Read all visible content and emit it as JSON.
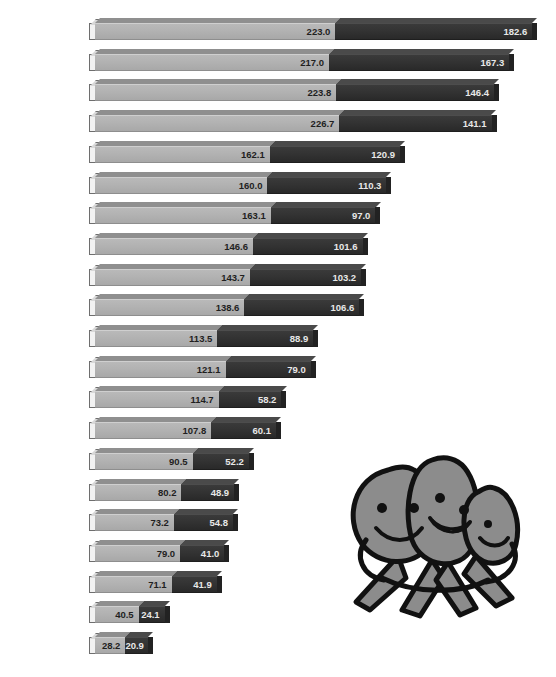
{
  "chart_data": {
    "type": "bar",
    "title": "",
    "subtitle": "",
    "xlabel": "",
    "ylabel": "",
    "orientation": "horizontal",
    "stacked": true,
    "grid": false,
    "legend_position": "none",
    "axis_visible": false,
    "xlim": [
      0,
      410
    ],
    "highlight_category": "United States",
    "categories": [
      "Finland",
      "United Kingdom",
      "Norway",
      "Ireland",
      "Australia",
      "New Zealand",
      "Iceland",
      "Netherlands",
      "Germany",
      "Austria",
      "United States",
      "Canada",
      "Greece",
      "Luxembourg",
      "Italy",
      "Portugal",
      "France",
      "Spain",
      "East Germany",
      "Soviet Union",
      "Japan"
    ],
    "series": [
      {
        "name": "light-segment",
        "color": "#b2b2b2",
        "values": [
          223.0,
          217.0,
          223.8,
          226.7,
          162.1,
          160.0,
          163.1,
          146.6,
          143.7,
          138.6,
          113.5,
          121.1,
          114.7,
          107.8,
          90.5,
          80.2,
          73.2,
          79.0,
          71.1,
          40.5,
          28.2
        ]
      },
      {
        "name": "dark-segment",
        "color": "#333333",
        "values": [
          182.6,
          167.3,
          146.4,
          141.1,
          120.9,
          110.3,
          97.0,
          101.6,
          103.2,
          106.6,
          88.9,
          79.0,
          58.2,
          60.1,
          52.2,
          48.9,
          54.8,
          41.0,
          41.9,
          24.1,
          20.9
        ]
      }
    ],
    "totals": [
      405.6,
      384.3,
      370.2,
      367.8,
      283.0,
      270.3,
      260.1,
      248.2,
      246.9,
      245.2,
      202.4,
      200.1,
      172.9,
      167.9,
      142.7,
      129.1,
      128.0,
      120.0,
      113.0,
      64.6,
      49.1
    ]
  },
  "illustration": {
    "name": "three-smiling-characters-mascot",
    "description": "Cartoon group of three smiling blob characters with legs",
    "fill_color": "#8c8c8c",
    "outline_color": "#111111"
  }
}
